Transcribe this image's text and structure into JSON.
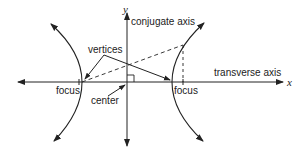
{
  "diagram": {
    "labels": {
      "y_axis": "y",
      "x_axis": "x",
      "conjugate_axis": "conjugate axis",
      "transverse_axis": "transverse axis",
      "vertices": "vertices",
      "focus_left": "focus",
      "focus_right": "focus",
      "center": "center"
    },
    "colors": {
      "ink": "#222222",
      "background": "#ffffff"
    }
  }
}
